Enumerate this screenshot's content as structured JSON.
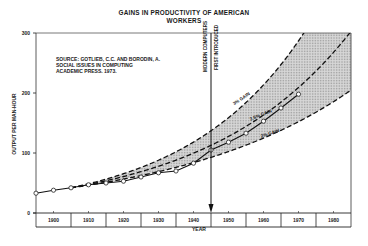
{
  "chart_data": {
    "type": "line",
    "title": "GAINS IN PRODUCTIVITY OF AMERICAN WORKERS",
    "title_lines": [
      "GAINS IN PRODUCTIVITY OF AMERICAN",
      "WORKERS"
    ],
    "xlabel": "YEAR",
    "ylabel": "OUTPUT PER MAN-HOUR",
    "xlim": [
      1895,
      1985
    ],
    "ylim": [
      0,
      300
    ],
    "x_ticks": [
      1900,
      1910,
      1920,
      1930,
      1940,
      1950,
      1960,
      1970,
      1980
    ],
    "y_ticks": [
      0,
      100,
      200,
      300
    ],
    "grid": false,
    "series": [
      {
        "name": "Actual output per man-hour",
        "style": "solid-with-open-circles",
        "x": [
          1895,
          1900,
          1905,
          1910,
          1915,
          1920,
          1925,
          1930,
          1935,
          1940,
          1945,
          1950,
          1955,
          1960,
          1965,
          1970
        ],
        "values": [
          33,
          38,
          42,
          47,
          50,
          53,
          60,
          67,
          70,
          83,
          105,
          118,
          133,
          153,
          175,
          198
        ]
      },
      {
        "name": "3% GAIN",
        "style": "dashed",
        "base_year": 1905,
        "base_value": 42,
        "rate": 0.03
      },
      {
        "name": "2.5% GAIN",
        "style": "dashed",
        "base_year": 1905,
        "base_value": 42,
        "rate": 0.025
      },
      {
        "name": "2% GAIN",
        "style": "dashed",
        "base_year": 1905,
        "base_value": 42,
        "rate": 0.02
      }
    ],
    "shaded_region": "between 3% GAIN and 2% GAIN curves",
    "annotations": [
      {
        "text": "MODERN COMPUTERS",
        "x": 1945,
        "type": "vertical-arrow"
      },
      {
        "text": "FIRST INTRODUCED",
        "x": 1945,
        "type": "vertical-arrow"
      }
    ],
    "source": [
      "SOURCE:  GOTLIEB, C.C. AND BORODIN, A.",
      "SOCIAL ISSUES IN COMPUTING",
      "ACADEMIC PRESS. 1973."
    ]
  },
  "labels": {
    "gain3": "3% GAIN",
    "gain25": "2.5% GAIN",
    "gain2": "2% GAIN",
    "arrow_line1": "MODERN COMPUTERS",
    "arrow_line2": "FIRST INTRODUCED"
  }
}
